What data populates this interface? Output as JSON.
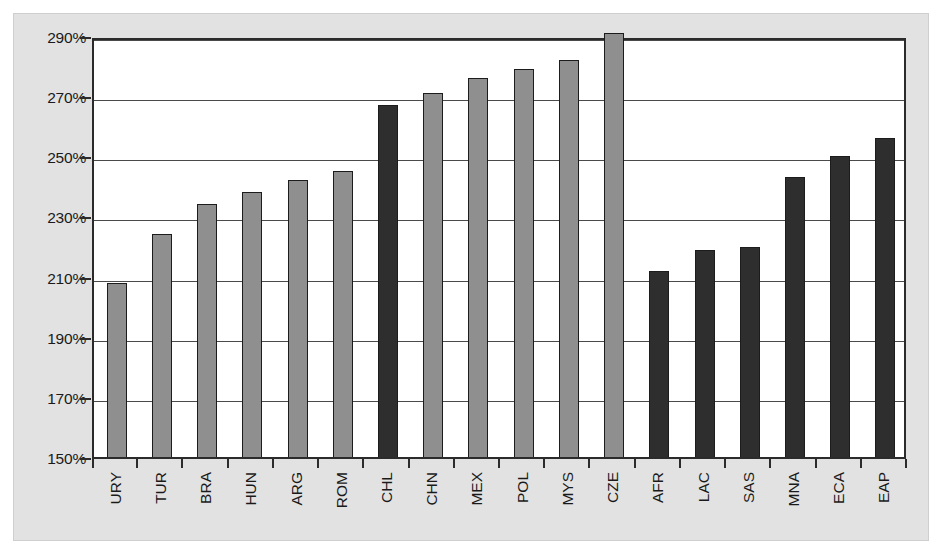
{
  "chart_data": {
    "type": "bar",
    "title": "",
    "subtitle": "",
    "xlabel": "",
    "ylabel": "",
    "ylim": [
      150,
      290
    ],
    "ytick_step": 20,
    "grid": true,
    "grid_axis": "y",
    "legend": null,
    "yticks": [
      "150%",
      "170%",
      "190%",
      "210%",
      "230%",
      "250%",
      "270%",
      "290%"
    ],
    "ytick_values": [
      150,
      170,
      190,
      210,
      230,
      250,
      270,
      290
    ],
    "value_suffix": "%",
    "categories": [
      "URY",
      "TUR",
      "BRA",
      "HUN",
      "ARG",
      "ROM",
      "CHL",
      "CHN",
      "MEX",
      "POL",
      "MYS",
      "CZE",
      "AFR",
      "LAC",
      "SAS",
      "MNA",
      "ECA",
      "EAP"
    ],
    "values": [
      208,
      224,
      234,
      238,
      242,
      245,
      267,
      271,
      276,
      279,
      282,
      291,
      212,
      219,
      220,
      243,
      250,
      256
    ],
    "bar_colors": [
      "light",
      "light",
      "light",
      "light",
      "light",
      "light",
      "dark",
      "light",
      "light",
      "light",
      "light",
      "light",
      "dark",
      "dark",
      "dark",
      "dark",
      "dark",
      "dark"
    ],
    "colors": {
      "bar_light": "#8f8f8f",
      "bar_dark": "#2e2e2e",
      "bar_edge": "#1c1c1c",
      "gridline": "#4a4a4a",
      "axis": "#2b2b2b",
      "plot_background": "#ffffff",
      "figure_background": "#e2e2e2",
      "text": "#1a1a1a"
    },
    "bars": [
      {
        "category": "URY",
        "value": 208,
        "style": "light"
      },
      {
        "category": "TUR",
        "value": 224,
        "style": "light"
      },
      {
        "category": "BRA",
        "value": 234,
        "style": "light"
      },
      {
        "category": "HUN",
        "value": 238,
        "style": "light"
      },
      {
        "category": "ARG",
        "value": 242,
        "style": "light"
      },
      {
        "category": "ROM",
        "value": 245,
        "style": "light"
      },
      {
        "category": "CHL",
        "value": 267,
        "style": "dark"
      },
      {
        "category": "CHN",
        "value": 271,
        "style": "light"
      },
      {
        "category": "MEX",
        "value": 276,
        "style": "light"
      },
      {
        "category": "POL",
        "value": 279,
        "style": "light"
      },
      {
        "category": "MYS",
        "value": 282,
        "style": "light"
      },
      {
        "category": "CZE",
        "value": 291,
        "style": "light"
      },
      {
        "category": "AFR",
        "value": 212,
        "style": "dark"
      },
      {
        "category": "LAC",
        "value": 219,
        "style": "dark"
      },
      {
        "category": "SAS",
        "value": 220,
        "style": "dark"
      },
      {
        "category": "MNA",
        "value": 243,
        "style": "dark"
      },
      {
        "category": "ECA",
        "value": 250,
        "style": "dark"
      },
      {
        "category": "EAP",
        "value": 256,
        "style": "dark"
      }
    ]
  }
}
